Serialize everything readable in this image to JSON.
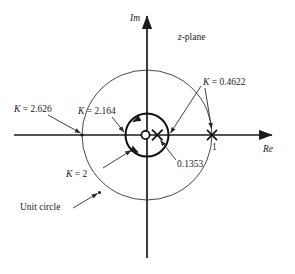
{
  "figure": {
    "kind": "root-locus-plot",
    "domain_label": "z-plane",
    "axes": {
      "imaginary_label": "Im",
      "real_label": "Re"
    },
    "annotations": {
      "unit_circle": "Unit circle",
      "real_axis_tick": "1",
      "zero_value": "0.1353"
    },
    "gain_labels": [
      {
        "id": "k-2-626",
        "text": "K = 2.626",
        "k_symbol": "K",
        "value": "2.626"
      },
      {
        "id": "k-2-164",
        "text": "K = 2.164",
        "k_symbol": "K",
        "value": "2.164"
      },
      {
        "id": "k-2",
        "text": "K = 2",
        "k_symbol": "K",
        "value": "2"
      },
      {
        "id": "k-0-4622",
        "text": "K = 0.4622",
        "k_symbol": "K",
        "value": "0.4622"
      }
    ],
    "colors": {
      "stroke": "#1a1a1a",
      "thin_stroke": "#3a3a3a",
      "background": "#ffffff"
    }
  },
  "chart_data": {
    "type": "scatter",
    "title": "",
    "subtitle": "z-plane",
    "xlabel": "Re",
    "ylabel": "Im",
    "xlim": [
      -1.35,
      1.35
    ],
    "ylim": [
      -1.35,
      1.35
    ],
    "grid": false,
    "legend": "none",
    "markers": [
      {
        "name": "zero",
        "symbol": "o",
        "x": 0.0,
        "y": 0.0,
        "label": ""
      },
      {
        "name": "pole-0.1353",
        "symbol": "x",
        "x": 0.1353,
        "y": 0.0,
        "label": "0.1353"
      },
      {
        "name": "pole-1",
        "symbol": "x",
        "x": 1.0,
        "y": 0.0,
        "label": "1"
      }
    ],
    "circles": [
      {
        "name": "unit-circle",
        "cx": 0.0,
        "cy": 0.0,
        "r": 1.0,
        "style": "thin",
        "label": "Unit circle"
      },
      {
        "name": "locus-circle",
        "cx": 0.0,
        "cy": 0.0,
        "r": 0.33,
        "style": "thick",
        "label": ""
      }
    ],
    "gain_points": [
      {
        "k": 2.626,
        "x": -1.0,
        "y": 0.0,
        "label": "K = 2.626"
      },
      {
        "k": 2.164,
        "x": -0.33,
        "y": 0.0,
        "label": "K = 2.164"
      },
      {
        "k": 2.0,
        "x": -0.26,
        "y": -0.21,
        "label": "K = 2"
      },
      {
        "k": 0.4622,
        "x": 0.33,
        "y": 0.0,
        "label": "K = 0.4622"
      },
      {
        "k": 0.4622,
        "x": 1.0,
        "y": 0.0,
        "label": "K = 0.4622"
      }
    ]
  }
}
